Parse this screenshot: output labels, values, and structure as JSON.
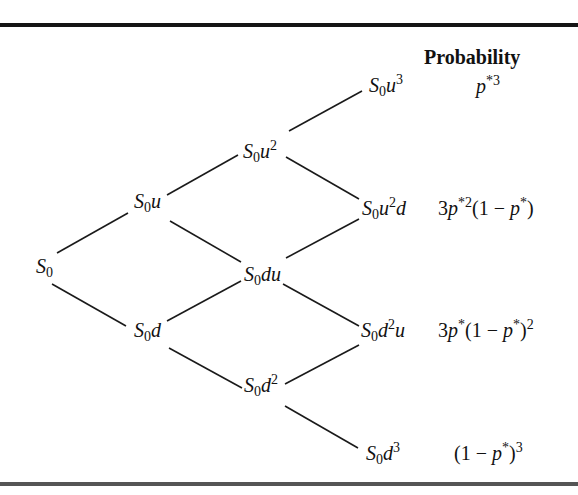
{
  "header": {
    "probability_label": "Probability"
  },
  "nodes": {
    "s0": {
      "base": "S",
      "sub": "0",
      "rest": "",
      "sup": "",
      "tail": ""
    },
    "s0u": {
      "base": "S",
      "sub": "0",
      "rest": "u",
      "sup": "",
      "tail": ""
    },
    "s0d": {
      "base": "S",
      "sub": "0",
      "rest": "d",
      "sup": "",
      "tail": ""
    },
    "s0u2": {
      "base": "S",
      "sub": "0",
      "rest": "u",
      "sup": "2",
      "tail": ""
    },
    "s0du": {
      "base": "S",
      "sub": "0",
      "rest": "du",
      "sup": "",
      "tail": ""
    },
    "s0d2": {
      "base": "S",
      "sub": "0",
      "rest": "d",
      "sup": "2",
      "tail": ""
    },
    "s0u3": {
      "base": "S",
      "sub": "0",
      "rest": "u",
      "sup": "3",
      "tail": ""
    },
    "s0u2d": {
      "base": "S",
      "sub": "0",
      "rest": "u",
      "sup": "2",
      "tail": "d"
    },
    "s0d2u": {
      "base": "S",
      "sub": "0",
      "rest": "d",
      "sup": "2",
      "tail": "u"
    },
    "s0d3": {
      "base": "S",
      "sub": "0",
      "rest": "d",
      "sup": "3",
      "tail": ""
    }
  },
  "probabilities": {
    "uuu": {
      "text": "p*3",
      "coef": "",
      "p": "p",
      "psup": "*3",
      "mid": "",
      "p2": "",
      "p2sup": "",
      "close": "",
      "closesup": ""
    },
    "uud": {
      "text": "3p*2(1 − p*)",
      "coef": "3",
      "p": "p",
      "psup": "*2",
      "mid": "(1 − ",
      "p2": "p",
      "p2sup": "*",
      "close": ")",
      "closesup": ""
    },
    "udd": {
      "text": "3p*(1 − p*)2",
      "coef": "3",
      "p": "p",
      "psup": "*",
      "mid": "(1 − ",
      "p2": "p",
      "p2sup": "*",
      "close": ")",
      "closesup": "2"
    },
    "ddd": {
      "text": "(1 − p*)3",
      "coef": "",
      "p": "",
      "psup": "",
      "mid": "(1 − ",
      "p2": "p",
      "p2sup": "*",
      "close": ")",
      "closesup": "3"
    }
  },
  "edges": [
    {
      "from": "s0",
      "to": "s0u",
      "x1": 57,
      "y1": 253,
      "x2": 128,
      "y2": 213
    },
    {
      "from": "s0",
      "to": "s0d",
      "x1": 52,
      "y1": 284,
      "x2": 126,
      "y2": 326
    },
    {
      "from": "s0u",
      "to": "s0u2",
      "x1": 167,
      "y1": 195,
      "x2": 238,
      "y2": 155
    },
    {
      "from": "s0u",
      "to": "s0du",
      "x1": 170,
      "y1": 221,
      "x2": 241,
      "y2": 262
    },
    {
      "from": "s0d",
      "to": "s0du",
      "x1": 167,
      "y1": 321,
      "x2": 241,
      "y2": 281
    },
    {
      "from": "s0d",
      "to": "s0d2",
      "x1": 169,
      "y1": 348,
      "x2": 242,
      "y2": 388
    },
    {
      "from": "s0u2",
      "to": "s0u3",
      "x1": 289,
      "y1": 131,
      "x2": 362,
      "y2": 91
    },
    {
      "from": "s0u2",
      "to": "s0u2d",
      "x1": 286,
      "y1": 157,
      "x2": 359,
      "y2": 199
    },
    {
      "from": "s0du",
      "to": "s0u2d",
      "x1": 286,
      "y1": 258,
      "x2": 359,
      "y2": 219
    },
    {
      "from": "s0du",
      "to": "s0d2u",
      "x1": 283,
      "y1": 284,
      "x2": 359,
      "y2": 326
    },
    {
      "from": "s0d2",
      "to": "s0d2u",
      "x1": 285,
      "y1": 384,
      "x2": 359,
      "y2": 345
    },
    {
      "from": "s0d2",
      "to": "s0d3",
      "x1": 285,
      "y1": 406,
      "x2": 358,
      "y2": 448
    }
  ]
}
